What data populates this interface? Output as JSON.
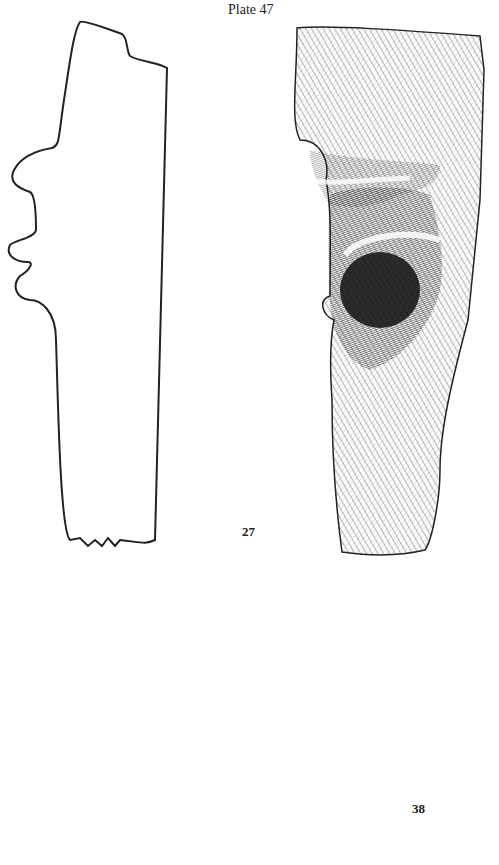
{
  "page": {
    "title": "Plate 47"
  },
  "figures": [
    {
      "number": "27",
      "description": "profile outline and hatched drawing of artifact"
    },
    {
      "number": "38",
      "description": "small hatched drawing of fragment"
    }
  ],
  "labels": {
    "fig27": "27",
    "fig38": "38"
  }
}
